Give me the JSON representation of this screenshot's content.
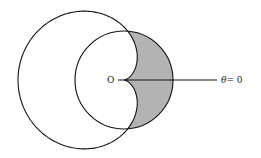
{
  "diagram": {
    "type": "polar-region",
    "origin": {
      "x": 124,
      "y": 80
    },
    "cardioid": {
      "equation": "r = a(1 - cos θ)",
      "a": 53
    },
    "circle": {
      "equation": "r = c",
      "r": 49
    },
    "shaded_region": "inside circle, outside cardioid",
    "colors": {
      "stroke": "#111111",
      "shade": "#b3b3b3",
      "background": "#ffffff"
    },
    "polar_axis": {
      "x_end": 217
    }
  },
  "labels": {
    "origin": "O",
    "axis_theta": "θ",
    "axis_eq": "= 0"
  }
}
